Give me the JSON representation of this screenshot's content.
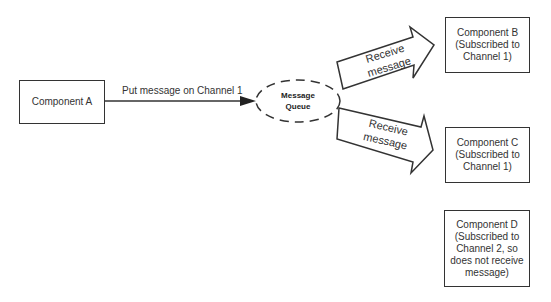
{
  "nodes": {
    "component_a": {
      "label": "Component A"
    },
    "queue": {
      "label": "Message\nQueue"
    },
    "component_b": {
      "label": "Component B\n(Subscribed to\nChannel 1)"
    },
    "component_c": {
      "label": "Component C\n(Subscribed to\nChannel 1)"
    },
    "component_d": {
      "label": "Component D\n(Subscribed to\nChannel 2, so\ndoes not receive\nmessage)"
    }
  },
  "edges": {
    "a_to_queue": {
      "label": "Put message on Channel 1"
    },
    "queue_to_b": {
      "label": "Receive\nmessage"
    },
    "queue_to_c": {
      "label": "Receive\nmessage"
    }
  }
}
